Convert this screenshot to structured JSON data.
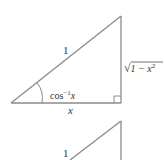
{
  "diagram": {
    "stroke_color": "#8a8a8a",
    "text_color": "#333333",
    "triangle1": {
      "vertices": {
        "left": [
          11,
          103
        ],
        "right": [
          121,
          103
        ],
        "top": [
          121,
          16
        ]
      },
      "hypotenuse_label": "1",
      "opposite_label_radical": "√",
      "opposite_label_body": "1 − x",
      "opposite_label_exp": "2",
      "adjacent_label": "x",
      "angle_label_base": "cos",
      "angle_label_exp": "−1",
      "angle_label_var": "x",
      "right_angle_marker": true
    },
    "triangle2": {
      "vertices": {
        "top": [
          121,
          121
        ],
        "hyp_bottom": [
          70,
          160
        ],
        "right_bottom": [
          121,
          160
        ]
      },
      "hypotenuse_label": "1"
    }
  }
}
